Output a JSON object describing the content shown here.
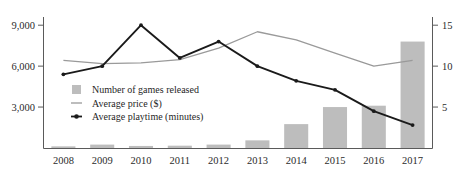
{
  "chart_data": {
    "type": "bar",
    "title": "",
    "subtitle": "",
    "xlabel": "",
    "ylabel": "",
    "categories": [
      "2008",
      "2009",
      "2010",
      "2011",
      "2012",
      "2013",
      "2014",
      "2015",
      "2016",
      "2017"
    ],
    "grid": false,
    "legend_position": "inside-left",
    "axes": {
      "left": {
        "ylabel": "",
        "ylim": [
          0,
          9600
        ],
        "ticks": [
          3000,
          6000,
          9000
        ],
        "tick_labels": [
          "3,000",
          "6,000",
          "9,000"
        ]
      },
      "right": {
        "ylabel": "",
        "ylim": [
          0,
          16
        ],
        "ticks": [
          5,
          10,
          15
        ],
        "tick_labels": [
          "5",
          "10",
          "15"
        ]
      }
    },
    "series": [
      {
        "name": "Number of games released",
        "type": "bar",
        "axis": "left",
        "color": "#bdbdbd",
        "values": [
          120,
          250,
          150,
          170,
          250,
          560,
          1750,
          3000,
          3100,
          7800
        ]
      },
      {
        "name": "Average price ($)",
        "type": "line",
        "axis": "right",
        "color": "#9a9a9a",
        "marker": "none",
        "values": [
          10.7,
          10.3,
          10.4,
          10.8,
          12.2,
          14.2,
          13.2,
          11.6,
          10.0,
          10.7
        ]
      },
      {
        "name": "Average playtime (minutes)",
        "type": "line",
        "axis": "right",
        "color": "#1a1a1a",
        "marker": "diamond",
        "values": [
          9.0,
          10.0,
          15.0,
          11.0,
          13.0,
          10.0,
          8.2,
          7.1,
          4.5,
          2.8
        ]
      }
    ]
  },
  "legend": {
    "items": [
      {
        "label": "Number of games released",
        "marker": "swatch",
        "color": "#bdbdbd"
      },
      {
        "label": "Average price ($)",
        "marker": "line",
        "color": "#9a9a9a"
      },
      {
        "label": "Average playtime (minutes)",
        "marker": "line-diamond",
        "color": "#1a1a1a"
      }
    ]
  }
}
